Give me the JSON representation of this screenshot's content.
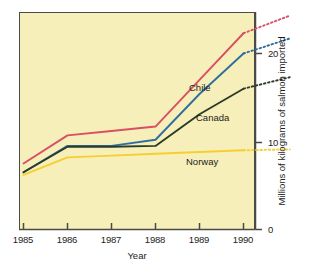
{
  "chart_data": {
    "type": "line",
    "title": "",
    "xlabel": "Year",
    "ylabel": "Millions of kilograms of salmon imported",
    "x": [
      1985,
      1986,
      1987,
      1988,
      1989,
      1990
    ],
    "xlim": [
      1984.9,
      1991.3
    ],
    "ylim": [
      0,
      24.6
    ],
    "xticks": [
      "1985",
      "1986",
      "1987",
      "1988",
      "1989",
      "1990"
    ],
    "yticks": [
      "0",
      "10",
      "20"
    ],
    "ytick_values": [
      0,
      10,
      20
    ],
    "grid": false,
    "legend": "inline-labels",
    "background": "#f7efb9",
    "series": [
      {
        "name": "Chile",
        "color": "#d94f63",
        "values": [
          7.5,
          10.7,
          11.2,
          11.7,
          17.0,
          22.3
        ],
        "projection": {
          "x": [
            1990,
            1991.05
          ],
          "values": [
            22.3,
            24.3
          ],
          "style": "dotted"
        }
      },
      {
        "name": "Chile-alt",
        "color": "#2f6f9e",
        "values": [
          6.5,
          9.5,
          9.5,
          10.2,
          15.4,
          20.0
        ],
        "projection": {
          "x": [
            1990,
            1991.05
          ],
          "values": [
            20.0,
            21.7
          ],
          "style": "dotted"
        }
      },
      {
        "name": "Canada",
        "color": "#2b3b26",
        "values": [
          6.5,
          9.4,
          9.4,
          9.5,
          13.1,
          16.0
        ],
        "projection": {
          "x": [
            1990,
            1991.05
          ],
          "values": [
            16.0,
            17.3
          ],
          "style": "dotted"
        }
      },
      {
        "name": "Norway",
        "color": "#f5cf31",
        "values": [
          6.2,
          8.2,
          8.4,
          8.6,
          8.8,
          9.0
        ],
        "projection": {
          "x": [
            1990,
            1991.05
          ],
          "values": [
            9.0,
            9.1
          ],
          "style": "dotted"
        }
      }
    ],
    "annotations": [
      {
        "text": "Chile",
        "series": "Chile-alt"
      },
      {
        "text": "Canada",
        "series": "Canada"
      },
      {
        "text": "Norway",
        "series": "Norway"
      }
    ]
  },
  "axes": {
    "x_title": "Year",
    "y_title": "Millions of kilograms of salmon imported",
    "x_tick_labels": [
      "1985",
      "1986",
      "1987",
      "1988",
      "1989",
      "1990"
    ],
    "y_tick_labels": [
      "0",
      "10",
      "20"
    ]
  },
  "labels": {
    "chile": "Chile",
    "canada": "Canada",
    "norway": "Norway"
  }
}
